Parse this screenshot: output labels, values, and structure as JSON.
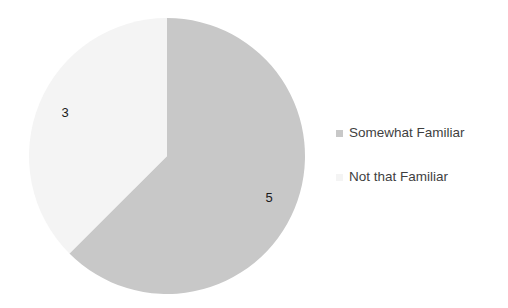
{
  "chart_data": {
    "type": "pie",
    "title": "",
    "categories": [
      "Somewhat Familiar",
      "Not that Familiar"
    ],
    "values": [
      5,
      3
    ],
    "data_labels": [
      "5",
      "3"
    ],
    "colors": [
      "#c8c8c8",
      "#f4f4f4"
    ],
    "total": 8,
    "start_angle_deg": 0,
    "direction": "clockwise",
    "legend_position": "right",
    "grid": false,
    "slices": [
      {
        "name": "Somewhat Familiar",
        "value": 5,
        "label": "5",
        "color": "#c8c8c8",
        "start_deg": 0,
        "end_deg": 225,
        "label_x": 284,
        "label_y": 215
      },
      {
        "name": "Not that Familiar",
        "value": 3,
        "label": "3",
        "color": "#f4f4f4",
        "start_deg": 225,
        "end_deg": 360,
        "label_x": 57,
        "label_y": 107
      }
    ]
  },
  "legend": {
    "items": [
      {
        "label": "Somewhat Familiar",
        "color": "#c8c8c8"
      },
      {
        "label": "Not that Familiar",
        "color": "#f4f4f4"
      }
    ]
  },
  "background_color": "#ffffff"
}
